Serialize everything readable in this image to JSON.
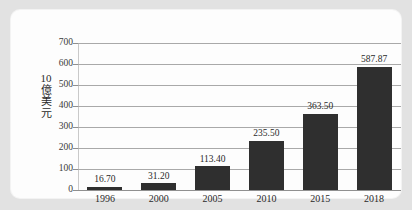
{
  "card": {
    "background_color": "#fdfdfd",
    "page_background_color": "#e2e2e2"
  },
  "chart_data": {
    "type": "bar",
    "title": "",
    "xlabel": "",
    "ylabel": "10億美元",
    "ylabel_lines": [
      "10",
      "億",
      "美",
      "元"
    ],
    "categories": [
      "1996",
      "2000",
      "2005",
      "2010",
      "2015",
      "2018"
    ],
    "values": [
      16.7,
      31.2,
      113.4,
      235.5,
      363.5,
      587.87
    ],
    "value_labels": [
      "16.70",
      "31.20",
      "113.40",
      "235.50",
      "363.50",
      "587.87"
    ],
    "ylim": [
      0,
      700
    ],
    "yticks": [
      0,
      100,
      200,
      300,
      400,
      500,
      600,
      700
    ],
    "ytick_labels": [
      "0",
      "100",
      "200",
      "300",
      "400",
      "500",
      "600",
      "700"
    ],
    "grid": "horizontal",
    "legend": "none",
    "bar_color": "#2f2f2f",
    "gridline_color": "#a9a9a9"
  }
}
